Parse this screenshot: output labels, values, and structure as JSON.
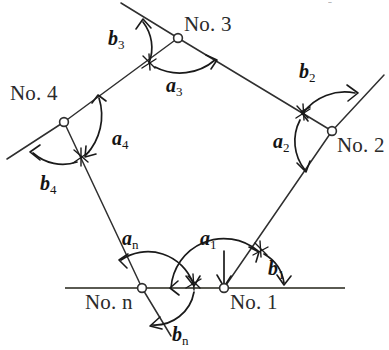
{
  "figure": {
    "type": "diagram",
    "background_color": "#ffffff",
    "line_color": "#2f2f2f",
    "baseline_color": "#5a5a52",
    "text_color": "#141414",
    "width": 389,
    "height": 350
  },
  "top_fragment": {
    "text": "- , , , ,"
  },
  "stations": [
    {
      "id": "no1",
      "label": "No. 1",
      "x": 224,
      "y": 288,
      "label_x": 230,
      "label_y": 309
    },
    {
      "id": "no2",
      "label": "No. 2",
      "x": 332,
      "y": 131,
      "label_x": 337,
      "label_y": 152
    },
    {
      "id": "no3",
      "label": "No. 3",
      "x": 178,
      "y": 38,
      "label_x": 184,
      "label_y": 31
    },
    {
      "id": "no4",
      "label": "No. 4",
      "x": 64,
      "y": 122,
      "label_x": 10,
      "label_y": 100
    },
    {
      "id": "non",
      "label": "No. n",
      "x": 142,
      "y": 288,
      "label_x": 85,
      "label_y": 309
    }
  ],
  "angles_a": [
    {
      "id": "a1",
      "base": "a",
      "sub": "1",
      "x": 200,
      "y": 245
    },
    {
      "id": "a2",
      "base": "a",
      "sub": "2",
      "x": 273,
      "y": 148
    },
    {
      "id": "a3",
      "base": "a",
      "sub": "3",
      "x": 166,
      "y": 92
    },
    {
      "id": "a4",
      "base": "a",
      "sub": "4",
      "x": 112,
      "y": 145
    },
    {
      "id": "an",
      "base": "a",
      "sub": "n",
      "x": 122,
      "y": 245
    }
  ],
  "angles_b": [
    {
      "id": "b1",
      "base": "b",
      "sub": "1",
      "x": 268,
      "y": 275
    },
    {
      "id": "b2",
      "base": "b",
      "sub": "2",
      "x": 299,
      "y": 78
    },
    {
      "id": "b3",
      "base": "b",
      "sub": "3",
      "x": 108,
      "y": 45
    },
    {
      "id": "b4",
      "base": "b",
      "sub": "4",
      "x": 40,
      "y": 190
    },
    {
      "id": "bn",
      "base": "b",
      "sub": "n",
      "x": 172,
      "y": 341
    }
  ],
  "baseline": {
    "label": "horizontal-reference-line",
    "x1": 65,
    "y1": 288,
    "x2": 345,
    "y2": 288
  },
  "rays": [
    {
      "id": "leg-n-to-1",
      "x1": 142,
      "y1": 288,
      "x2": 224,
      "y2": 288
    },
    {
      "id": "leg-1-to-2",
      "x1": 224,
      "y1": 288,
      "x2": 332,
      "y2": 131
    },
    {
      "id": "leg-2-to-3",
      "x1": 332,
      "y1": 131,
      "x2": 178,
      "y2": 38
    },
    {
      "id": "leg-3-to-4",
      "x1": 178,
      "y1": 38,
      "x2": 64,
      "y2": 122
    },
    {
      "id": "leg-4-to-n",
      "x1": 64,
      "y1": 122,
      "x2": 142,
      "y2": 288
    },
    {
      "id": "ext-at-3",
      "x1": 178,
      "y1": 38,
      "x2": 122,
      "y2": 4
    },
    {
      "id": "ext-at-2",
      "x1": 332,
      "y1": 131,
      "x2": 383,
      "y2": 76
    },
    {
      "id": "ext-at-4",
      "x1": 64,
      "y1": 122,
      "x2": 8,
      "y2": 158
    },
    {
      "id": "ext-at-n",
      "x1": 142,
      "y1": 288,
      "x2": 170,
      "y2": 335
    }
  ]
}
